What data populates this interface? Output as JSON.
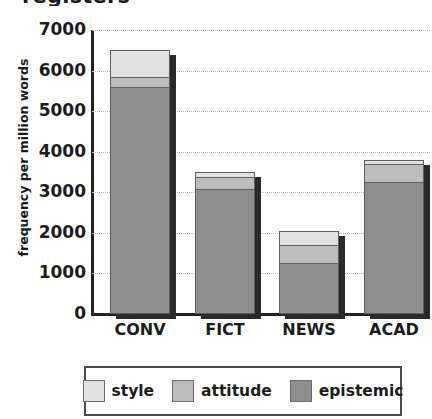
{
  "chart_data": {
    "type": "bar",
    "subtype": "stacked-bar",
    "title": "registers",
    "xlabel": "",
    "ylabel": "frequency per million words",
    "categories": [
      "CONV",
      "FICT",
      "NEWS",
      "ACAD"
    ],
    "series": [
      {
        "name": "epistemic",
        "values": [
          5600,
          3080,
          1250,
          3250
        ],
        "color": "#8e8e8e"
      },
      {
        "name": "attitude",
        "values": [
          250,
          300,
          450,
          450
        ],
        "color": "#bdbdbd"
      },
      {
        "name": "style",
        "values": [
          650,
          120,
          350,
          100
        ],
        "color": "#e2e2e2"
      }
    ],
    "totals": [
      6500,
      3500,
      2050,
      3800
    ],
    "stack_order_bottom_to_top": [
      "epistemic",
      "attitude",
      "style"
    ],
    "ylim": [
      0,
      7000
    ],
    "ytick_labels": [
      "7000",
      "6000",
      "5000",
      "4000",
      "3000",
      "2000",
      "1000",
      "0"
    ],
    "ytick_values": [
      7000,
      6000,
      5000,
      4000,
      3000,
      2000,
      1000,
      0
    ],
    "grid": true,
    "grid_style": "dotted-horizontal",
    "legend_position": "bottom",
    "legend_entries": [
      "style",
      "attitude",
      "epistemic"
    ]
  },
  "colors": {
    "style": "#e2e2e2",
    "attitude": "#bdbdbd",
    "epistemic": "#8e8e8e",
    "axis": "#222222",
    "grid": "#b9b9b9",
    "text": "#1c1c1c",
    "shadow": "#2a2a2a",
    "legend_border": "#4a4a4a"
  }
}
